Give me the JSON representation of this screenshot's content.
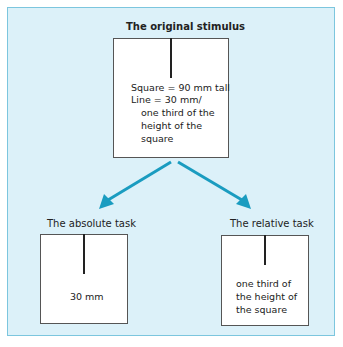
{
  "diagram": {
    "top": {
      "title": "The original stimulus",
      "lines": [
        "Square = 90 mm tall",
        "Line = 30 mm/",
        "one third of the",
        "height of the",
        "square"
      ]
    },
    "left": {
      "title": "The absolute task",
      "label": "30 mm"
    },
    "right": {
      "title": "The relative task",
      "lines": [
        "one third of",
        "the height of",
        "the square"
      ]
    },
    "colors": {
      "background": "#dcf1f9",
      "frame_border": "#7cc6de",
      "arrow": "#1a9cc0"
    }
  }
}
